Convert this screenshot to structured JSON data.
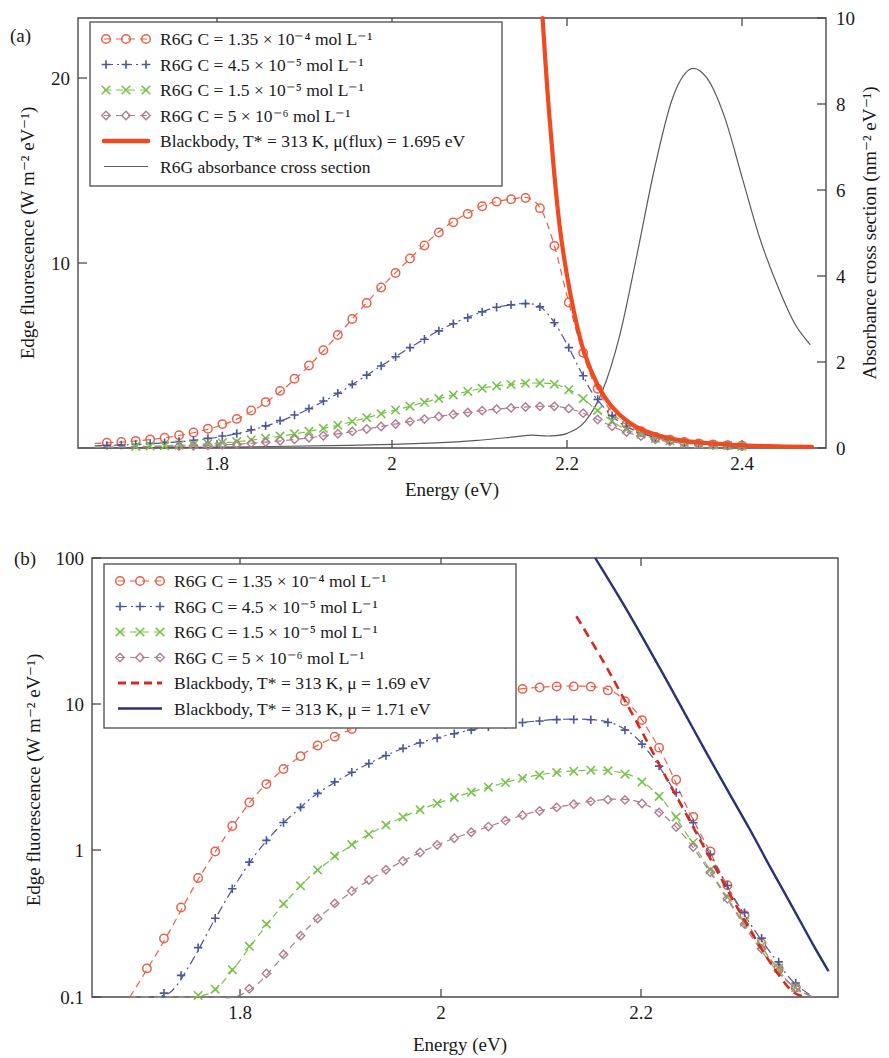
{
  "figure": {
    "panel_a_tag": "(a)",
    "panel_b_tag": "(b)"
  },
  "panel_a": {
    "xlabel": "Energy (eV)",
    "ylabel_left": "Edge fluorescence (W m⁻² eV⁻¹)",
    "ylabel_right": "Absorbance cross section (nm⁻² eV⁻¹)",
    "xticks": [
      "1.8",
      "2",
      "2.2",
      "2.4"
    ],
    "yticks_left": [
      "10",
      "20"
    ],
    "yticks_right": [
      "0",
      "2",
      "4",
      "6",
      "8",
      "10"
    ],
    "legend": [
      {
        "label": "R6G C = 1.35 × 10⁻⁴ mol L⁻¹",
        "marker": "circle",
        "color": "#e8614a",
        "style": "dashed"
      },
      {
        "label": "R6G C = 4.5 × 10⁻⁵ mol L⁻¹",
        "marker": "plus",
        "color": "#4d5699",
        "style": "dashdot"
      },
      {
        "label": "R6G C = 1.5 × 10⁻⁵ mol L⁻¹",
        "marker": "cross",
        "color": "#77c24a",
        "style": "dashed"
      },
      {
        "label": "R6G C = 5 × 10⁻⁶ mol L⁻¹",
        "marker": "diamond",
        "color": "#b07c94",
        "style": "dashed"
      },
      {
        "label": "Blackbody, T* = 313 K, μ(flux) = 1.695 eV",
        "marker": "thickline",
        "color": "#f04a20",
        "style": "solid"
      },
      {
        "label": "R6G absorbance cross section",
        "marker": "thinline",
        "color": "#5a5a58",
        "style": "solid"
      }
    ]
  },
  "panel_b": {
    "xlabel": "Energy (eV)",
    "ylabel_left": "Edge fluorescence (W m⁻² eV⁻¹)",
    "xticks": [
      "1.8",
      "2",
      "2.2"
    ],
    "yticks_left": [
      "0.1",
      "1",
      "10",
      "100"
    ],
    "legend": [
      {
        "label": "R6G C = 1.35 × 10⁻⁴ mol L⁻¹",
        "marker": "circle",
        "color": "#e8614a",
        "style": "dashed"
      },
      {
        "label": "R6G C = 4.5 × 10⁻⁵ mol L⁻¹",
        "marker": "plus",
        "color": "#4d5699",
        "style": "dashdot"
      },
      {
        "label": "R6G C = 1.5 × 10⁻⁵ mol L⁻¹",
        "marker": "cross",
        "color": "#77c24a",
        "style": "dashed"
      },
      {
        "label": "R6G C = 5 × 10⁻⁶ mol L⁻¹",
        "marker": "diamond",
        "color": "#b07c94",
        "style": "dashed"
      },
      {
        "label": "Blackbody, T* = 313 K, μ = 1.69 eV",
        "marker": "dashline",
        "color": "#d42a20",
        "style": "dashed"
      },
      {
        "label": "Blackbody, T* = 313 K, μ = 1.71 eV",
        "marker": "solidline",
        "color": "#2b3172",
        "style": "solid"
      }
    ]
  },
  "chart_data": [
    {
      "type": "line",
      "panel": "a",
      "title": "",
      "xlabel": "Energy (eV)",
      "ylabel": "Edge fluorescence (W m-2 eV-1)",
      "ylabel_secondary": "Absorbance cross section (nm-2 eV-1)",
      "xlim": [
        1.641,
        2.496
      ],
      "ylim": [
        0,
        23.2
      ],
      "ylim_secondary": [
        0,
        10
      ],
      "grid": false,
      "legend_position": "top-left-inside",
      "x": [
        1.66,
        1.7,
        1.74,
        1.78,
        1.82,
        1.86,
        1.9,
        1.94,
        1.98,
        2.02,
        2.06,
        2.1,
        2.12,
        2.14,
        2.155,
        2.17,
        2.185,
        2.2,
        2.215,
        2.23,
        2.25,
        2.27,
        2.3,
        2.33,
        2.36,
        2.4,
        2.44,
        2.48
      ],
      "series": [
        {
          "name": "R6G C = 1.35e-4 mol L-1",
          "color": "#e8614a",
          "marker": "circle",
          "values": [
            0.25,
            0.35,
            0.55,
            0.9,
            1.5,
            2.6,
            4.2,
            6.2,
            8.3,
            10.2,
            11.9,
            13.0,
            13.3,
            13.45,
            13.5,
            12.9,
            11.0,
            8.2,
            5.6,
            3.6,
            2.0,
            1.2,
            0.6,
            0.35,
            0.2,
            0.12,
            0.08,
            0.05
          ]
        },
        {
          "name": "R6G C = 4.5e-5 mol L-1",
          "color": "#4d5699",
          "marker": "plus",
          "values": [
            0.12,
            0.18,
            0.28,
            0.45,
            0.75,
            1.25,
            2.0,
            3.0,
            4.2,
            5.4,
            6.5,
            7.3,
            7.6,
            7.75,
            7.8,
            7.6,
            6.8,
            5.6,
            4.2,
            2.9,
            1.8,
            1.1,
            0.58,
            0.33,
            0.19,
            0.11,
            0.07,
            0.05
          ]
        },
        {
          "name": "R6G C = 1.5e-5 mol L-1",
          "color": "#77c24a",
          "marker": "cross",
          "values": [
            0.05,
            0.08,
            0.12,
            0.2,
            0.33,
            0.55,
            0.85,
            1.25,
            1.75,
            2.25,
            2.75,
            3.2,
            3.35,
            3.45,
            3.5,
            3.5,
            3.45,
            3.2,
            2.8,
            2.2,
            1.5,
            0.95,
            0.52,
            0.3,
            0.18,
            0.1,
            0.07,
            0.045
          ]
        },
        {
          "name": "R6G C = 5e-6 mol L-1",
          "color": "#b07c94",
          "marker": "diamond",
          "values": [
            0.03,
            0.05,
            0.08,
            0.13,
            0.2,
            0.33,
            0.52,
            0.78,
            1.1,
            1.42,
            1.75,
            2.0,
            2.1,
            2.18,
            2.22,
            2.25,
            2.25,
            2.15,
            1.95,
            1.65,
            1.2,
            0.82,
            0.47,
            0.28,
            0.17,
            0.1,
            0.065,
            0.04
          ]
        },
        {
          "name": "Blackbody, T* = 313 K, mu(flux) = 1.695 eV",
          "color": "#f04a20",
          "marker": "thickline",
          "comment": "steep exponential-like decay entering from top of frame near 2.175 eV",
          "x": [
            2.172,
            2.178,
            2.185,
            2.192,
            2.2,
            2.21,
            2.22,
            2.235,
            2.25,
            2.27,
            2.29,
            2.32,
            2.35,
            2.39,
            2.43,
            2.48
          ],
          "values": [
            23.2,
            19.0,
            15.0,
            11.8,
            9.3,
            6.9,
            5.1,
            3.4,
            2.3,
            1.4,
            0.9,
            0.5,
            0.3,
            0.17,
            0.1,
            0.06
          ]
        }
      ],
      "secondary_series": [
        {
          "name": "R6G absorbance cross section",
          "color": "#5a5a58",
          "axis": "right",
          "x": [
            1.641,
            1.8,
            1.95,
            2.05,
            2.1,
            2.14,
            2.16,
            2.18,
            2.2,
            2.22,
            2.24,
            2.26,
            2.28,
            2.3,
            2.32,
            2.34,
            2.36,
            2.38,
            2.4,
            2.42,
            2.44,
            2.46,
            2.478
          ],
          "values": [
            0.0,
            0.02,
            0.06,
            0.12,
            0.18,
            0.26,
            0.3,
            0.28,
            0.34,
            0.6,
            1.3,
            2.6,
            4.5,
            6.5,
            8.1,
            8.8,
            8.6,
            7.7,
            6.3,
            4.9,
            3.8,
            2.9,
            2.4
          ]
        }
      ]
    },
    {
      "type": "line",
      "panel": "b",
      "title": "",
      "xlabel": "Energy (eV)",
      "ylabel": "Edge fluorescence (W m-2 eV-1)",
      "xlim": [
        1.684,
        2.394
      ],
      "ylim": [
        0.1,
        100
      ],
      "yscale": "log",
      "grid": false,
      "legend_position": "top-left-inside",
      "x": [
        1.72,
        1.74,
        1.76,
        1.78,
        1.8,
        1.82,
        1.84,
        1.86,
        1.88,
        1.9,
        1.94,
        1.98,
        2.02,
        2.06,
        2.1,
        2.13,
        2.16,
        2.18,
        2.2,
        2.215,
        2.23,
        2.25,
        2.27,
        2.29,
        2.31,
        2.33,
        2.35,
        2.37
      ],
      "series": [
        {
          "name": "R6G C = 1.35e-4 mol L-1",
          "color": "#e8614a",
          "marker": "circle",
          "values": [
            0.1,
            0.17,
            0.3,
            0.55,
            0.95,
            1.55,
            2.4,
            3.3,
            4.3,
            5.3,
            7.2,
            9.0,
            10.6,
            11.9,
            12.9,
            13.3,
            13.2,
            12.2,
            9.2,
            6.4,
            4.1,
            2.0,
            1.05,
            0.55,
            0.3,
            0.18,
            0.12,
            0.1
          ]
        },
        {
          "name": "R6G C = 4.5e-5 mol L-1",
          "color": "#4d5699",
          "marker": "plus",
          "values": [
            0.1,
            0.1,
            0.11,
            0.18,
            0.33,
            0.58,
            0.95,
            1.4,
            1.9,
            2.5,
            3.7,
            5.0,
            6.1,
            7.0,
            7.6,
            7.9,
            7.85,
            7.4,
            6.1,
            4.6,
            3.2,
            1.8,
            1.0,
            0.55,
            0.32,
            0.2,
            0.13,
            0.1
          ]
        },
        {
          "name": "R6G C = 1.5e-5 mol L-1",
          "color": "#77c24a",
          "marker": "cross",
          "values": [
            0.1,
            0.1,
            0.1,
            0.1,
            0.11,
            0.16,
            0.25,
            0.38,
            0.55,
            0.75,
            1.2,
            1.7,
            2.2,
            2.7,
            3.2,
            3.45,
            3.55,
            3.5,
            3.2,
            2.7,
            2.1,
            1.3,
            0.78,
            0.46,
            0.28,
            0.18,
            0.12,
            0.1
          ]
        },
        {
          "name": "R6G C = 5e-6 mol L-1",
          "color": "#b07c94",
          "marker": "diamond",
          "values": [
            0.1,
            0.1,
            0.1,
            0.1,
            0.1,
            0.1,
            0.12,
            0.17,
            0.25,
            0.35,
            0.58,
            0.85,
            1.15,
            1.45,
            1.8,
            2.0,
            2.18,
            2.25,
            2.2,
            2.0,
            1.7,
            1.2,
            0.75,
            0.45,
            0.27,
            0.17,
            0.12,
            0.1
          ]
        },
        {
          "name": "Blackbody, T* = 313 K, mu = 1.69 eV",
          "color": "#d42a20",
          "marker": "dashline",
          "x": [
            2.145,
            2.17,
            2.19,
            2.21,
            2.23,
            2.25,
            2.27,
            2.29,
            2.31,
            2.33,
            2.35,
            2.365
          ],
          "values": [
            40.0,
            20.0,
            11.0,
            6.0,
            3.2,
            1.75,
            0.95,
            0.52,
            0.29,
            0.17,
            0.11,
            0.09
          ]
        },
        {
          "name": "Blackbody, T* = 313 K, mu = 1.71 eV",
          "color": "#2b3172",
          "marker": "solidline",
          "x": [
            2.163,
            2.19,
            2.21,
            2.23,
            2.25,
            2.27,
            2.29,
            2.31,
            2.33,
            2.35,
            2.37,
            2.385
          ],
          "values": [
            100.0,
            48.0,
            27.0,
            15.0,
            8.2,
            4.5,
            2.5,
            1.4,
            0.76,
            0.42,
            0.23,
            0.15
          ]
        }
      ]
    }
  ]
}
